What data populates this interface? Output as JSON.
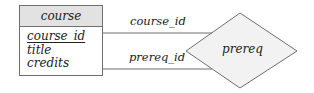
{
  "diagram": {
    "type": "er-diagram",
    "entity": {
      "name": "course",
      "attributes": [
        {
          "name": "course_id",
          "primary_key": true
        },
        {
          "name": "title",
          "primary_key": false
        },
        {
          "name": "credits",
          "primary_key": false
        }
      ]
    },
    "relationship": {
      "name": "prereq"
    },
    "edges": [
      {
        "from": "course",
        "to": "prereq",
        "role": "course_id"
      },
      {
        "from": "course",
        "to": "prereq",
        "role": "prereq_id"
      }
    ],
    "colors": {
      "entity_header_fill": "#e2e2e2",
      "relationship_fill": "#f2f2f2",
      "stroke": "#6f6f6f",
      "text": "#222222"
    }
  }
}
